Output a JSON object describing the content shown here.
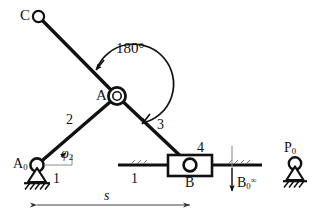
{
  "diagram": {
    "stroke_color": "#111111",
    "hatch_color": "#111111",
    "thin_color": "#4a4a4a",
    "labels": {
      "point_c": "C",
      "point_a": "A",
      "point_a0_base": "A",
      "point_a0_sub": "0",
      "point_b": "B",
      "point_b0_base": "B",
      "point_b0_sub": "0",
      "point_b0_sup": "∞",
      "point_p0_base": "P",
      "point_p0_sub": "0",
      "angle_180": "180°",
      "angle_phi2_base": "φ",
      "angle_phi2_sub": "2",
      "link_1_left": "1",
      "link_1_right": "1",
      "link_2": "2",
      "link_3": "3",
      "link_4": "4",
      "dimension_s": "s"
    },
    "geometry": {
      "A0": [
        37,
        165
      ],
      "A": [
        117,
        96
      ],
      "C": [
        38,
        16
      ],
      "B": [
        190,
        165
      ],
      "B0_axis_x": [
        232
      ],
      "P0": [
        295,
        165
      ],
      "slider_box": [
        168,
        155,
        44,
        21
      ],
      "guide_line_y": 165,
      "dimension_line_y": 205,
      "dimension_from_x": 37,
      "dimension_to_x": 190
    }
  }
}
